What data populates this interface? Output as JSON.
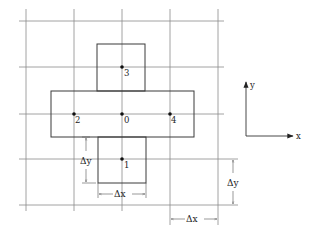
{
  "diagram": {
    "points": [
      {
        "id": "0",
        "label": "0",
        "col": 0,
        "row": 0
      },
      {
        "id": "1",
        "label": "1",
        "col": 0,
        "row": -1
      },
      {
        "id": "2",
        "label": "2",
        "col": -1,
        "row": 0
      },
      {
        "id": "3",
        "label": "3",
        "col": 0,
        "row": 1
      },
      {
        "id": "4",
        "label": "4",
        "col": 1,
        "row": 0
      }
    ],
    "dimensions": {
      "dx_label": "Δx",
      "dy_label": "Δy"
    },
    "axes": {
      "x_label": "x",
      "y_label": "y"
    }
  }
}
